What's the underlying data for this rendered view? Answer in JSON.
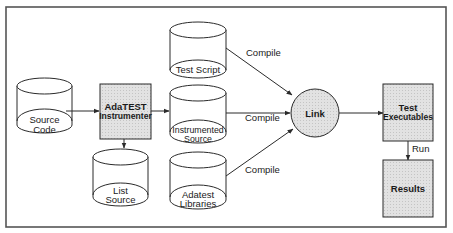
{
  "diagram": {
    "colors": {
      "stroke": "#2a2a2a",
      "frame": "#555555",
      "shaded_fill": "#dcdcdc",
      "background": "#ffffff"
    },
    "nodes": {
      "source_code": {
        "type": "cylinder",
        "lines": [
          "Source",
          "Code"
        ]
      },
      "instrumenter": {
        "type": "process-box",
        "lines": [
          "AdaTEST",
          "Instrumenter"
        ]
      },
      "test_script": {
        "type": "cylinder",
        "lines": [
          "Test Script"
        ]
      },
      "instrumented_source": {
        "type": "cylinder",
        "lines": [
          "Instrumented",
          "Source"
        ]
      },
      "adatest_libraries": {
        "type": "cylinder",
        "lines": [
          "Adatest",
          "Libraries"
        ]
      },
      "list_source": {
        "type": "cylinder",
        "lines": [
          "List",
          "Source"
        ]
      },
      "link": {
        "type": "circle",
        "lines": [
          "Link"
        ]
      },
      "test_executables": {
        "type": "process-box",
        "lines": [
          "Test",
          "Executables"
        ]
      },
      "results": {
        "type": "process-box",
        "lines": [
          "Results"
        ]
      }
    },
    "edges": [
      {
        "from": "source_code",
        "to": "instrumenter",
        "label": ""
      },
      {
        "from": "instrumenter",
        "to": "instrumented_source",
        "label": ""
      },
      {
        "from": "instrumenter",
        "to": "list_source",
        "label": ""
      },
      {
        "from": "test_script",
        "to": "link",
        "label": "Compile"
      },
      {
        "from": "instrumented_source",
        "to": "link",
        "label": "Compile"
      },
      {
        "from": "adatest_libraries",
        "to": "link",
        "label": "Compile"
      },
      {
        "from": "link",
        "to": "test_executables",
        "label": ""
      },
      {
        "from": "test_executables",
        "to": "results",
        "label": "Run"
      }
    ]
  }
}
